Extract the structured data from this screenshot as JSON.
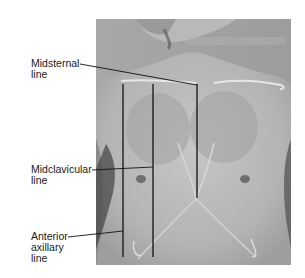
{
  "figure": {
    "labels": [
      {
        "id": "midsternal",
        "line1": "Midsternal",
        "line2": "line"
      },
      {
        "id": "midclavicular",
        "line1": "Midclavicular",
        "line2": "line"
      },
      {
        "id": "anterior-axillary",
        "line1": "Anterior",
        "line2": "axillary",
        "line3": "line"
      }
    ]
  },
  "colors": {
    "background": "#ffffff",
    "photo_base": "#a9a9a9",
    "skin_light": "#c4c4c4",
    "skin_mid": "#b2b2b2",
    "shadow": "#3a3a3a",
    "line": "#111111",
    "clavicle_highlight": "#e6e6e6"
  }
}
